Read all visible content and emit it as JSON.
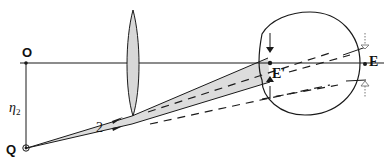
{
  "diagram": {
    "type": "optics-ray-diagram",
    "labels": {
      "origin": "O",
      "object_point": "Q",
      "height": "η",
      "height_subscript": "2",
      "ray_label": "2",
      "image_point_inner": "E'",
      "image_point_outer": "E"
    },
    "colors": {
      "line": "#1a1a1a",
      "beam_fill": "#dcdcdc",
      "lens_fill": "#d8d8d8",
      "dotted_arrow": "#777777"
    },
    "elements": [
      "optical-axis",
      "lens",
      "eye",
      "light-beam",
      "dashed-virtual-rays",
      "pupil-arrows",
      "exit-arrows"
    ]
  }
}
